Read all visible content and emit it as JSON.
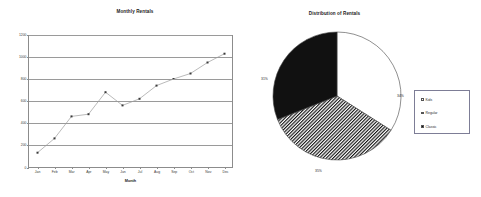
{
  "chart_data": [
    {
      "type": "line",
      "title": "Monthly Rentals",
      "xlabel": "Month",
      "ylabel": "",
      "categories": [
        "Jan",
        "Feb",
        "Mar",
        "Apr",
        "May",
        "Jun",
        "Jul",
        "Aug",
        "Sep",
        "Oct",
        "Nov",
        "Dec"
      ],
      "values": [
        130,
        260,
        460,
        480,
        680,
        560,
        620,
        740,
        800,
        850,
        950,
        1030
      ],
      "yticks": [
        "0",
        "200",
        "400",
        "600",
        "800",
        "1000",
        "1200"
      ],
      "ylim": [
        0,
        1200
      ],
      "grid": true,
      "legend": "none",
      "marker": "square",
      "line_color": "#808080"
    },
    {
      "type": "pie",
      "title": "Distribution of Rentals",
      "labels": [
        "Kids",
        "Regular",
        "Classic"
      ],
      "values": [
        34,
        35,
        31
      ],
      "data_labels": [
        "34%",
        "35%",
        "31%"
      ],
      "legend_position": "right",
      "slice_styles": [
        "white",
        "hatched",
        "black"
      ]
    }
  ],
  "line_chart": {
    "title": "Monthly Rentals",
    "xaxis_title": "Month",
    "yticks": [
      "0",
      "200",
      "400",
      "600",
      "800",
      "1000",
      "1200"
    ],
    "months": [
      "Jan",
      "Feb",
      "Mar",
      "Apr",
      "May",
      "Jun",
      "Jul",
      "Aug",
      "Sep",
      "Oct",
      "Nov",
      "Dec"
    ]
  },
  "pie_chart": {
    "title": "Distribution of Rentals",
    "pct_kids": "34%",
    "pct_regular": "35%",
    "pct_classic": "31%",
    "legend": {
      "kids": "Kids",
      "regular": "Regular",
      "classic": "Classic"
    }
  }
}
